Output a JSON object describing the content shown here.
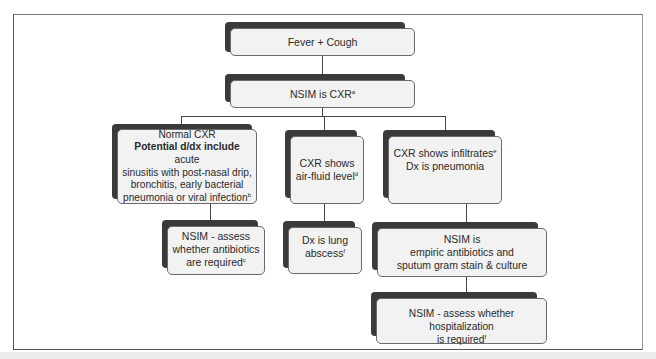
{
  "diagram": {
    "type": "flowchart",
    "nodes": {
      "fever_cough": {
        "text": "Fever + Cough"
      },
      "nsim_cxr": {
        "text": "NSIM is CXR",
        "sup": "a"
      },
      "normal_cxr": {
        "line1": "Normal CXR",
        "bold": "Potential d/dx include",
        "rest1": " acute",
        "line3": "sinusitis with post-nasal drip,",
        "line4": "bronchitis, early bacterial",
        "line5": "pneumonia or viral infection",
        "sup": "b"
      },
      "air_fluid": {
        "line1": "CXR shows",
        "line2": "air-fluid level",
        "sup": "d"
      },
      "infiltrates": {
        "line1": "CXR shows infiltrates",
        "sup": "e",
        "line2": "Dx  is pneumonia"
      },
      "assess_antibiotics": {
        "line1": "NSIM - assess",
        "line2": "whether antibiotics",
        "line3": "are required",
        "sup": "c"
      },
      "lung_abscess": {
        "line1": "Dx is lung",
        "line2": "abscess",
        "sup": "f"
      },
      "empiric": {
        "line1": "NSIM is",
        "line2": "empiric antibiotics and",
        "line3": "sputum gram stain & culture"
      },
      "hospitalization": {
        "line1": "NSIM  - assess whether hospitalization",
        "line2": "is required",
        "sup": "f"
      }
    },
    "edges": [
      [
        "fever_cough",
        "nsim_cxr"
      ],
      [
        "nsim_cxr",
        "normal_cxr"
      ],
      [
        "nsim_cxr",
        "air_fluid"
      ],
      [
        "nsim_cxr",
        "infiltrates"
      ],
      [
        "normal_cxr",
        "assess_antibiotics"
      ],
      [
        "air_fluid",
        "lung_abscess"
      ],
      [
        "infiltrates",
        "empiric"
      ],
      [
        "empiric",
        "hospitalization"
      ]
    ],
    "colors": {
      "box_fill": "#f2f2f2",
      "shadow": "#3a3a3a",
      "line": "#444444"
    }
  }
}
